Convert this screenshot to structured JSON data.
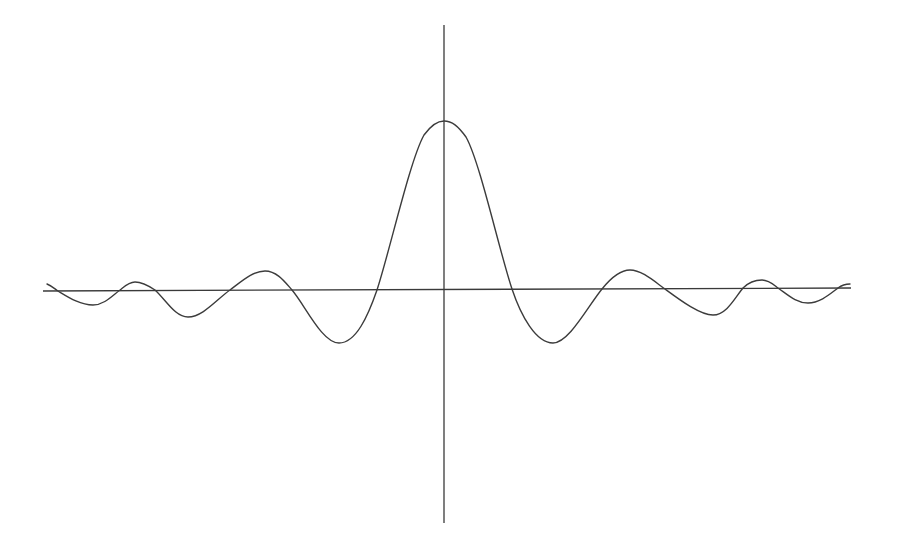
{
  "chart_data": {
    "type": "line",
    "title": "",
    "subtitle": "",
    "xlabel": "",
    "ylabel": "",
    "grid": false,
    "legend": null,
    "x_tick_labels": [],
    "y_tick_labels": [],
    "axes": {
      "x_axis_px": {
        "x1": 43,
        "y1": 291,
        "x2": 851,
        "y2": 288
      },
      "y_axis_px": {
        "x1": 444,
        "y1": 25,
        "x2": 444,
        "y2": 523
      }
    },
    "units_note": "x in units of first-zero spacing (1 unit ≈ 67 px), y normalized to central peak = 1 (168 px)",
    "series": [
      {
        "name": "f(x)",
        "color": "#3c3c3c",
        "x": [
          -5.93,
          -5.76,
          -5.24,
          -4.84,
          -4.61,
          -4.31,
          -3.88,
          -3.22,
          -2.67,
          -2.27,
          -1.57,
          -1.0,
          0.0,
          1.0,
          1.66,
          2.34,
          2.76,
          3.3,
          4.01,
          4.3,
          4.55,
          5.0,
          5.9,
          6.08
        ],
        "y": [
          0.03,
          -0.01,
          -0.09,
          0.0,
          0.05,
          0.0,
          -0.17,
          0.0,
          0.11,
          0.0,
          -0.32,
          0.0,
          1.0,
          0.0,
          -0.32,
          0.0,
          0.11,
          0.0,
          -0.16,
          0.0,
          0.05,
          -0.08,
          0.0,
          0.03
        ]
      }
    ],
    "extrema": {
      "peak": {
        "x": 0.0,
        "y": 1.0
      },
      "first_minima": [
        {
          "x": -1.57,
          "y": -0.32
        },
        {
          "x": 1.66,
          "y": -0.32
        }
      ],
      "second_maxima": [
        {
          "x": -2.67,
          "y": 0.11
        },
        {
          "x": 2.76,
          "y": 0.11
        }
      ],
      "second_minima": [
        {
          "x": -3.88,
          "y": -0.17
        },
        {
          "x": 4.01,
          "y": -0.16
        }
      ],
      "third_maxima": [
        {
          "x": -4.61,
          "y": 0.05
        },
        {
          "x": 4.75,
          "y": 0.05
        }
      ],
      "third_minima": [
        {
          "x": -5.24,
          "y": -0.09
        },
        {
          "x": 5.43,
          "y": -0.08
        }
      ]
    },
    "xlim": [
      -6.0,
      6.1
    ],
    "ylim": [
      -1.4,
      1.6
    ]
  },
  "plot": {
    "curve_path": "M47,284 C52,286 55,289 58,291 C68,297 80,305 93,305 C104,305 112,296 120,290 C125,286 129,282 135,282 C142,282 149,286 155,290 C166,300 175,317 188,317 C203,317 217,299 230,290 C242,281 253,271 265,271 C277,271 285,282 292,290 C305,305 322,343 339,343 C356,343 368,316 377,290 C390,250 410,160 424,135 C432,124 438,121 444,121 C452,121 458,126 466,137 C480,162 499,250 512,289 C521,316 536,343 553,343 C569,343 588,306 602,289 C610,279 620,270 630,270 C642,270 655,282 665,289 C680,300 700,315 713,315 C727,315 736,296 743,288 C748,283 755,280 762,280 C769,280 774,285 778,288 C787,294 796,303 808,303 C820,303 830,294 838,288 C842,285 846,284 850,284",
    "x_axis_path": "M43,291 L851,288",
    "y_axis_path": "M444,25 L444,523"
  }
}
